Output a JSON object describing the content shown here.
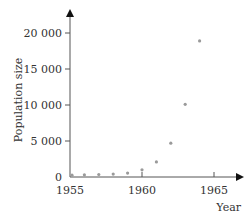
{
  "chart_data": {
    "type": "scatter",
    "title": "",
    "xlabel": "Year",
    "ylabel": "Population size",
    "x": [
      1955,
      1956,
      1957,
      1958,
      1959,
      1960,
      1961,
      1962,
      1963,
      1964
    ],
    "values": [
      250,
      300,
      350,
      400,
      550,
      1000,
      2100,
      4700,
      10100,
      18900
    ],
    "xlim": [
      1955,
      1966.5
    ],
    "ylim": [
      0,
      22000
    ],
    "x_ticks": [
      1955,
      1960,
      1965
    ],
    "y_ticks": [
      0,
      5000,
      10000,
      15000,
      20000
    ],
    "x_tick_labels": [
      "1955",
      "1960",
      "1965"
    ],
    "y_tick_labels": [
      "0",
      "5 000",
      "10 000",
      "15 000",
      "20 000"
    ],
    "grid": false,
    "legend": null,
    "marker_color": "#9a9a9a",
    "axis_color": "#555555"
  }
}
